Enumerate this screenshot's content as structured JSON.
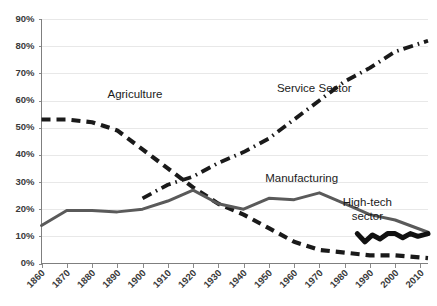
{
  "chart_data": {
    "type": "line",
    "title": "",
    "xlabel": "",
    "ylabel": "",
    "xlim": [
      1860,
      2013
    ],
    "ylim": [
      0,
      90
    ],
    "grid": true,
    "legend": "inline-annotations",
    "ytick_labels": [
      "0%",
      "10%",
      "20%",
      "30%",
      "40%",
      "50%",
      "60%",
      "70%",
      "80%",
      "90%"
    ],
    "ytick_values": [
      0,
      10,
      20,
      30,
      40,
      50,
      60,
      70,
      80,
      90
    ],
    "xtick_labels": [
      "1860",
      "1870",
      "1880",
      "1890",
      "1900",
      "1910",
      "1920",
      "1930",
      "1940",
      "1950",
      "1960",
      "1970",
      "1980",
      "1990",
      "2000",
      "2010"
    ],
    "xtick_values": [
      1860,
      1870,
      1880,
      1890,
      1900,
      1910,
      1920,
      1930,
      1940,
      1950,
      1960,
      1970,
      1980,
      1990,
      2000,
      2010
    ],
    "series": [
      {
        "name": "Agriculture",
        "label": "Agriculture",
        "style": "dashed",
        "color": "#1a1a1a",
        "x": [
          1860,
          1870,
          1880,
          1890,
          1900,
          1910,
          1920,
          1930,
          1940,
          1950,
          1960,
          1970,
          1980,
          1990,
          2000,
          2013
        ],
        "values": [
          53,
          53,
          52,
          49,
          42,
          35,
          28,
          22,
          18,
          13,
          8,
          5,
          4,
          3,
          3,
          2
        ]
      },
      {
        "name": "Manufacturing",
        "label": "Manufacturing",
        "style": "solid",
        "color": "#5a5a5a",
        "x": [
          1860,
          1870,
          1880,
          1890,
          1900,
          1910,
          1920,
          1930,
          1940,
          1950,
          1960,
          1970,
          1980,
          1990,
          2000,
          2013
        ],
        "values": [
          14,
          19.5,
          19.5,
          19,
          20,
          23,
          27,
          22,
          20,
          24,
          23.5,
          26,
          22,
          18,
          16,
          11.5
        ]
      },
      {
        "name": "Service Sector",
        "label": "Service Sector",
        "style": "dash-dot",
        "color": "#1a1a1a",
        "x": [
          1900,
          1910,
          1920,
          1930,
          1940,
          1950,
          1960,
          1970,
          1980,
          1990,
          2000,
          2013
        ],
        "values": [
          24,
          29,
          32,
          37,
          41,
          46,
          53,
          60,
          67,
          72,
          78,
          82
        ]
      },
      {
        "name": "High-tech sector",
        "label": "High-tech sector",
        "style": "solid-thick",
        "color": "#111111",
        "x": [
          1985,
          1988,
          1991,
          1994,
          1997,
          2000,
          2003,
          2006,
          2009,
          2013
        ],
        "values": [
          11,
          8,
          10.5,
          9,
          11,
          11,
          9.5,
          11,
          10,
          11
        ]
      }
    ],
    "annotations": [
      {
        "text": "Agriculture",
        "x": 1897,
        "y": 61
      },
      {
        "text": "Service Sector",
        "x": 1968,
        "y": 63
      },
      {
        "text": "Manufacturing",
        "x": 1963,
        "y": 30
      },
      {
        "text": "High-tech",
        "x": 1989,
        "y": 21
      },
      {
        "text": "sector",
        "x": 1989,
        "y": 16
      }
    ]
  },
  "style": {
    "background": "#ffffff",
    "gridline_color": "#e8e8e8",
    "axis_color": "#7f7f7f",
    "tick_text_color": "#3a3a3a",
    "annotation_color": "#1b1b1b"
  }
}
